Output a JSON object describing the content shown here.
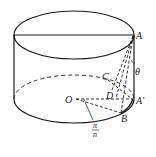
{
  "diagram": {
    "type": "geometry-cylinder",
    "stroke_color": "#1a1a1a",
    "background": "#ffffff",
    "labels": {
      "A": "A",
      "A_prime": "A′",
      "B": "B",
      "C": "C",
      "D": "D",
      "O": "O",
      "theta": "θ",
      "angle_num": "π",
      "angle_den": "n"
    }
  }
}
